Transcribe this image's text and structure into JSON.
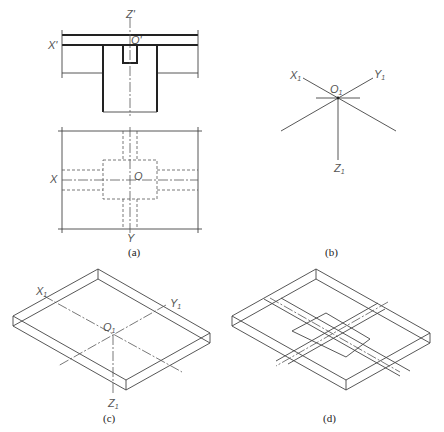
{
  "figure": {
    "panels": [
      {
        "id": "a",
        "caption": "(a)",
        "description": "Elevation and plan of slab-column joint",
        "labels": {
          "z_axis": "Z'",
          "x_axis_elev": "X'",
          "origin_elev": "O'",
          "x_axis_plan": "X",
          "origin_plan": "O",
          "y_axis_plan": "Y"
        }
      },
      {
        "id": "b",
        "caption": "(b)",
        "description": "Isometric axes",
        "labels": {
          "x": "X",
          "y": "Y",
          "z": "Z",
          "origin": "O",
          "subscript": "1"
        }
      },
      {
        "id": "c",
        "caption": "(c)",
        "description": "Isometric slab with axes",
        "labels": {
          "x": "X",
          "y": "Y",
          "z": "Z",
          "origin": "O",
          "subscript": "1"
        }
      },
      {
        "id": "d",
        "caption": "(d)",
        "description": "Isometric slab with beams and column outline"
      }
    ]
  }
}
